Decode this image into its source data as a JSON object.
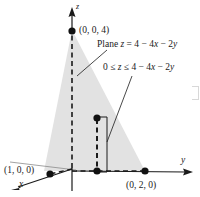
{
  "figure": {
    "kind": "3d-coordinate-diagram",
    "background_color": "#ffffff",
    "shade_color": "#e2e2e2",
    "ink_color": "#1a1a1a",
    "axes": {
      "z_label": "z",
      "y_label": "y",
      "x_label": "x"
    },
    "points": [
      {
        "name": "z-intercept",
        "label": "(0, 0, 4)"
      },
      {
        "name": "x-intercept",
        "label": "(1, 0, 0)"
      },
      {
        "name": "y-intercept",
        "label": "(0, 2, 0)"
      }
    ],
    "annotations": {
      "plane_label": "Plane z = 4 − 4x − 2y",
      "plane_label_parts": {
        "prefix": "Plane ",
        "var_z": "z",
        "equals": " = 4 − 4",
        "var_x": "x",
        "minus": " − 2",
        "var_y": "y"
      },
      "inequality_label": "0 ≤ z ≤ 4 − 4x − 2y",
      "inequality_label_parts": {
        "lead": "0 ≤ ",
        "var_z": "z",
        "mid": " ≤ 4 − 4",
        "var_x": "x",
        "minus": " − 2",
        "var_y": "y"
      }
    }
  }
}
